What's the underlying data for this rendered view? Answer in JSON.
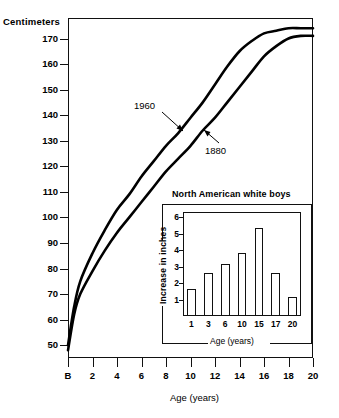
{
  "main": {
    "y_axis_title": "Centimeters",
    "x_axis_title": "Age (years)",
    "y_ticks": [
      "170",
      "160",
      "150",
      "140",
      "130",
      "120",
      "110",
      "100",
      "90",
      "80",
      "70",
      "60",
      "50"
    ],
    "x_ticks": [
      "B",
      "2",
      "4",
      "6",
      "8",
      "10",
      "12",
      "14",
      "16",
      "18",
      "20"
    ],
    "annotations": {
      "series_1960": "1960",
      "series_1880": "1880"
    }
  },
  "inset": {
    "title": "North American white boys",
    "y_axis_title": "Increase in inches",
    "x_axis_title": "Age (years)",
    "y_ticks": [
      "6",
      "5",
      "4",
      "3",
      "2",
      "1"
    ],
    "x_ticks": [
      "1",
      "3",
      "6",
      "10",
      "15",
      "17",
      "20"
    ]
  },
  "chart_data": [
    {
      "type": "line",
      "title": "",
      "xlabel": "Age (years)",
      "ylabel": "Centimeters",
      "xlim": [
        0,
        20
      ],
      "ylim": [
        45,
        178
      ],
      "xtick_labels": [
        "B",
        "2",
        "4",
        "6",
        "8",
        "10",
        "12",
        "14",
        "16",
        "18",
        "20"
      ],
      "xtick_values": [
        0,
        2,
        4,
        6,
        8,
        10,
        12,
        14,
        16,
        18,
        20
      ],
      "ytick_values": [
        50,
        60,
        70,
        80,
        90,
        100,
        110,
        120,
        130,
        140,
        150,
        160,
        170
      ],
      "grid": false,
      "legend": "inline annotations on curves",
      "series": [
        {
          "name": "1960",
          "x": [
            0,
            0.5,
            1,
            2,
            3,
            4,
            5,
            6,
            7,
            8,
            9,
            10,
            11,
            12,
            13,
            14,
            15,
            16,
            17,
            18,
            19,
            20
          ],
          "values": [
            50,
            65,
            75,
            86,
            95,
            103,
            109,
            116,
            122,
            128,
            133,
            139,
            145,
            152,
            159,
            165,
            169,
            172,
            173,
            174,
            174,
            174
          ]
        },
        {
          "name": "1880",
          "x": [
            0,
            0.5,
            1,
            2,
            3,
            4,
            5,
            6,
            7,
            8,
            9,
            10,
            11,
            12,
            13,
            14,
            15,
            16,
            17,
            18,
            19,
            20
          ],
          "values": [
            48,
            62,
            70,
            79,
            87,
            94,
            100,
            106,
            112,
            118,
            123,
            128,
            134,
            139,
            145,
            151,
            157,
            163,
            167,
            170,
            171,
            171
          ]
        }
      ]
    },
    {
      "type": "bar",
      "title": "North American white boys",
      "xlabel": "Age (years)",
      "ylabel": "Increase in inches",
      "categories": [
        "1",
        "3",
        "6",
        "10",
        "15",
        "17",
        "20"
      ],
      "values": [
        1.65,
        2.6,
        3.15,
        3.8,
        5.35,
        2.6,
        1.15
      ],
      "ylim": [
        0,
        6.3
      ],
      "ytick_values": [
        1,
        2,
        3,
        4,
        5,
        6
      ],
      "grid": false
    }
  ]
}
